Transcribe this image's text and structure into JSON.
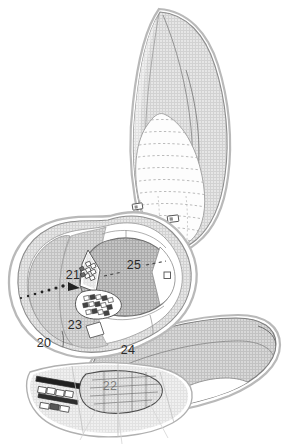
{
  "map": {
    "kind": "archaeological-site-plan",
    "canvas": {
      "width": 290,
      "height": 447
    },
    "background_color": "#ffffff",
    "palette": {
      "outline_dark": "#6f6f6f",
      "outline_mid": "#8d8d8d",
      "outline_light": "#b4b4b4",
      "fill_hatch_light": "#dcdcdc",
      "fill_hatch_mid": "#c9c9c9",
      "fill_shadow_dark": "#9a9a9a",
      "fill_white": "#ffffff",
      "label_color": "#2a2a2a",
      "contour_dash_color": "#a9a9a9",
      "building_stroke": "#3a3a3a"
    },
    "zones": [
      {
        "id": "zone-20",
        "label": "20",
        "x": 44,
        "y": 347,
        "description": "large hatched western terrace field"
      },
      {
        "id": "zone-21",
        "label": "21",
        "x": 73,
        "y": 279,
        "description": "upper building cluster on northwest slope"
      },
      {
        "id": "zone-22",
        "label": "22",
        "x": 110,
        "y": 390,
        "description": "southern partially-obscured precinct"
      },
      {
        "id": "zone-23",
        "label": "23",
        "x": 75,
        "y": 329,
        "description": "lower dense building cluster"
      },
      {
        "id": "zone-24",
        "label": "24",
        "x": 128,
        "y": 354,
        "description": "elongated southeast arm / causeway"
      },
      {
        "id": "zone-25",
        "label": "25",
        "x": 134,
        "y": 269,
        "description": "central oval plaza / courtyard"
      }
    ],
    "features": {
      "upper_lobe": "tall northern leaf-shaped ridge with shaded eastern flank",
      "terraced_field": "fan of dashed contour terrace lines in lower half of upper lobe",
      "terrace_structures": 2,
      "plaza_marker": 1,
      "dotted_path_count": 2,
      "building_cluster_count": 3
    }
  }
}
